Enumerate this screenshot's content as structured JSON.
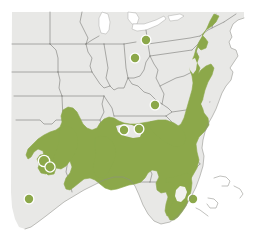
{
  "map": {
    "title": "Species distribution range map — eastern and southeastern United States",
    "type": "range-map",
    "region": "Eastern United States",
    "width": 254,
    "height": 241,
    "colors": {
      "background": "#ffffff",
      "land": "#e8e8e6",
      "water": "#ffffff",
      "border": "#6f706d",
      "range_fill": "#8ca84a",
      "range_outline": "#8ca84a",
      "point_fill": "#8ca84a",
      "point_halo": "#ffffff"
    },
    "legend": {
      "visible": false,
      "entries": [
        {
          "label": "Continuous range",
          "color": "#8ca84a",
          "symbol": "fill"
        },
        {
          "label": "Isolated occurrence",
          "color": "#8ca84a",
          "symbol": "dot"
        }
      ]
    },
    "labels": [],
    "scale_bar": {
      "visible": false,
      "text": ""
    },
    "north_arrow": {
      "visible": false
    },
    "attribution": {
      "visible": false,
      "text": ""
    },
    "range_description": "Contiguous shaded range covering the Atlantic Coastal Plain from southern New England and Long Island south through the Delmarva Peninsula, the Carolinas and Georgia, all of Florida except a central-southern gap, west across the Gulf Coastal Plain through Alabama, Mississippi, Louisiana and eastern Texas.",
    "outlier_description": "Isolated disjunct populations shown as filled circles in northern Ohio, central Indiana, eastern Kentucky/Tennessee, northern Alabama, southern Texas coast and southeastern Florida.",
    "isolated_points": [
      {
        "id": "pt-ohio-north",
        "region": "northern Ohio",
        "cx": 146,
        "cy": 40,
        "r": 4.2
      },
      {
        "id": "pt-indiana-central",
        "region": "central Indiana",
        "cx": 135,
        "cy": 58,
        "r": 4.2
      },
      {
        "id": "pt-kentucky-east",
        "region": "eastern Kentucky / Tennessee",
        "cx": 155,
        "cy": 105,
        "r": 4.2
      },
      {
        "id": "pt-tennessee-south",
        "region": "southern Tennessee",
        "cx": 124,
        "cy": 130,
        "r": 4.2
      },
      {
        "id": "pt-alabama-north",
        "region": "northern Alabama",
        "cx": 139,
        "cy": 129,
        "r": 4.2
      },
      {
        "id": "pt-texas-coast",
        "region": "southern Texas coast",
        "cx": 29,
        "cy": 199,
        "r": 4.2
      },
      {
        "id": "pt-florida-southeast",
        "region": "southeastern Florida",
        "cx": 193,
        "cy": 199,
        "r": 4.2
      },
      {
        "id": "pt-texas-hill-a",
        "region": "central Texas",
        "cx": 44,
        "cy": 161,
        "r": 5.0
      },
      {
        "id": "pt-texas-hill-b",
        "region": "central Texas",
        "cx": 50,
        "cy": 167,
        "r": 4.4
      }
    ]
  }
}
